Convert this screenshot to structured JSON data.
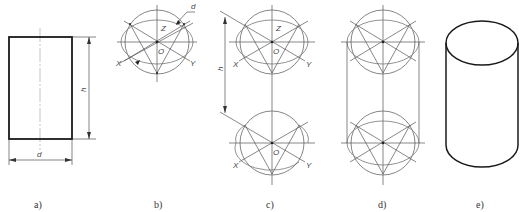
{
  "figure": {
    "panels": [
      {
        "id": "a",
        "caption": "a)",
        "description": "Front view rectangle of cylinder with dimensions",
        "dimensions": {
          "height": "h",
          "diameter": "d"
        }
      },
      {
        "id": "b",
        "caption": "b)",
        "description": "Circle with isometric axes and inscribed ellipse",
        "labels": {
          "z": "Z",
          "x": "X",
          "y": "Y",
          "origin": "O",
          "diameter": "d"
        }
      },
      {
        "id": "c",
        "caption": "c)",
        "description": "Two ellipse constructions separated by height h",
        "labels": {
          "z": "Z",
          "x": "X",
          "y": "Y",
          "origin": "O",
          "height": "h"
        }
      },
      {
        "id": "d",
        "caption": "d)",
        "description": "Two ellipses connected by tangent lines",
        "labels": {}
      },
      {
        "id": "e",
        "caption": "e)",
        "description": "Finished isometric cylinder",
        "labels": {}
      }
    ]
  }
}
